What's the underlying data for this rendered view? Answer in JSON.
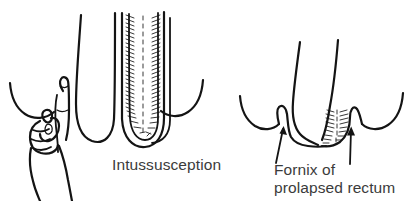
{
  "figure": {
    "kind": "medical-line-illustration",
    "background_color": "#ffffff",
    "ink_color": "#141414",
    "text_color": "#3b3b3b",
    "width": 413,
    "height": 201
  },
  "panels": [
    {
      "id": "left",
      "name": "intussusception-panel",
      "caption": "Intussusception",
      "elements": [
        "examining-hand",
        "index-finger",
        "perineal-skin-left",
        "perineal-skin-right",
        "outer-rectal-wall",
        "intussuscepting-inner-tube",
        "mucosal-folds-hatching"
      ]
    },
    {
      "id": "right",
      "name": "prolapse-panel",
      "caption_line_1": "Fornix of",
      "caption_line_2": "prolapsed rectum",
      "elements": [
        "perineal-skin-left",
        "perineal-skin-right",
        "prolapsed-rectum-funnel",
        "fornix-sulcus-left",
        "fornix-sulcus-right",
        "mucosal-folds-hatching",
        "pointer-arrow-left",
        "pointer-arrow-right"
      ]
    }
  ],
  "labels": {
    "intussusception": "Intussusception",
    "fornix_line_1": "Fornix of",
    "fornix_line_2": "prolapsed rectum"
  },
  "annotations": {
    "arrow_left_name": "arrow-to-fornix-left",
    "arrow_right_name": "arrow-to-fornix-right",
    "arrow_count": 2
  }
}
